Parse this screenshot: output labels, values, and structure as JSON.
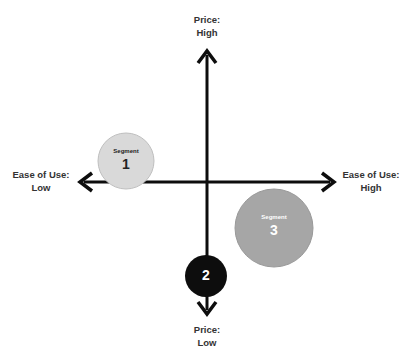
{
  "diagram": {
    "type": "perceptual-map",
    "axes": {
      "vertical": {
        "name": "Price",
        "top_label": [
          "Price:",
          "High"
        ],
        "bottom_label": [
          "Price:",
          "Low"
        ]
      },
      "horizontal": {
        "name": "Ease of Use",
        "left_label": [
          "Ease of Use:",
          "Low"
        ],
        "right_label": [
          "Ease of Use:",
          "High"
        ]
      }
    },
    "segments": [
      {
        "id": 1,
        "caption": "Segment",
        "number": "1",
        "fill": "#d9d9d9",
        "text_color": "#222222",
        "quadrant": "low ease of use, slightly high price"
      },
      {
        "id": 2,
        "caption": "",
        "number": "2",
        "fill": "#0d0d0d",
        "text_color": "#ffffff",
        "quadrant": "neutral ease of use, low price"
      },
      {
        "id": 3,
        "caption": "Segment",
        "number": "3",
        "fill": "#a6a6a6",
        "text_color": "#ffffff",
        "quadrant": "high ease of use, low price"
      }
    ],
    "colors": {
      "axis": "#0d0d0d",
      "label_text": "#333333"
    }
  }
}
